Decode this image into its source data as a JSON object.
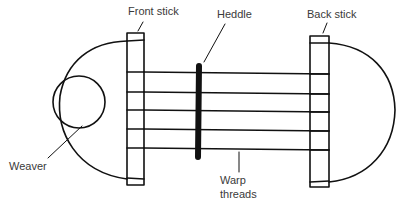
{
  "diagram": {
    "type": "backstrap-loom-diagram",
    "labels": {
      "front_stick": "Front stick",
      "heddle": "Heddle",
      "back_stick": "Back stick",
      "weaver": "Weaver",
      "warp_line1": "Warp",
      "warp_line2": "threads"
    },
    "components": [
      {
        "id": "front-stick",
        "label": "Front stick"
      },
      {
        "id": "heddle",
        "label": "Heddle"
      },
      {
        "id": "back-stick",
        "label": "Back stick"
      },
      {
        "id": "weaver",
        "label": "Weaver"
      },
      {
        "id": "warp-threads",
        "label": "Warp threads",
        "count": 5
      }
    ],
    "colors": {
      "line": "#111111",
      "text": "#3a3a3a",
      "background": "#ffffff"
    }
  }
}
